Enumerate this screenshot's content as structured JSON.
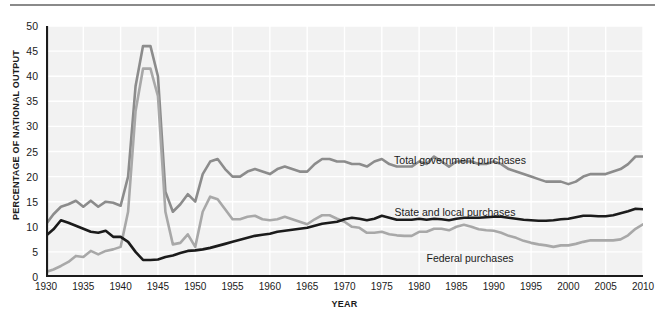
{
  "chart_data": {
    "type": "line",
    "title": "",
    "xlabel": "YEAR",
    "ylabel": "PERCENTAGE OF NATIONAL OUTPUT",
    "xlim": [
      1930,
      2010
    ],
    "ylim": [
      0,
      50
    ],
    "grid": true,
    "legend_position": "inline-annotations",
    "xticks": [
      "1930",
      "1935",
      "1940",
      "1945",
      "1950",
      "1955",
      "1960",
      "1965",
      "1970",
      "1975",
      "1980",
      "1985",
      "1990",
      "1995",
      "2000",
      "2005",
      "2010"
    ],
    "yticks": [
      "0",
      "5",
      "10",
      "15",
      "20",
      "25",
      "30",
      "35",
      "40",
      "45",
      "50"
    ],
    "x": [
      1930,
      1931,
      1932,
      1933,
      1934,
      1935,
      1936,
      1937,
      1938,
      1939,
      1940,
      1941,
      1942,
      1943,
      1944,
      1945,
      1946,
      1947,
      1948,
      1949,
      1950,
      1951,
      1952,
      1953,
      1954,
      1955,
      1956,
      1957,
      1958,
      1959,
      1960,
      1961,
      1962,
      1963,
      1964,
      1965,
      1966,
      1967,
      1968,
      1969,
      1970,
      1971,
      1972,
      1973,
      1974,
      1975,
      1976,
      1977,
      1978,
      1979,
      1980,
      1981,
      1982,
      1983,
      1984,
      1985,
      1986,
      1987,
      1988,
      1989,
      1990,
      1991,
      1992,
      1993,
      1994,
      1995,
      1996,
      1997,
      1998,
      1999,
      2000,
      2001,
      2002,
      2003,
      2004,
      2005,
      2006,
      2007,
      2008,
      2009,
      2010
    ],
    "series": [
      {
        "name": "Total government purchases",
        "color": "#8c8c8c",
        "values": [
          10.5,
          12.5,
          14.0,
          14.5,
          15.2,
          14.0,
          15.2,
          14.0,
          15.0,
          14.8,
          14.2,
          20.0,
          38.0,
          46.0,
          46.0,
          40.0,
          17.0,
          13.0,
          14.5,
          16.5,
          15.0,
          20.5,
          23.0,
          23.5,
          21.5,
          20.0,
          20.0,
          21.0,
          21.5,
          21.0,
          20.5,
          21.5,
          22.0,
          21.5,
          21.0,
          21.0,
          22.5,
          23.5,
          23.5,
          23.0,
          23.0,
          22.5,
          22.5,
          22.0,
          23.0,
          23.5,
          22.5,
          22.0,
          22.0,
          22.0,
          23.0,
          22.5,
          24.0,
          23.0,
          22.0,
          23.0,
          23.0,
          23.0,
          22.5,
          22.5,
          23.0,
          22.5,
          21.5,
          21.0,
          20.5,
          20.0,
          19.5,
          19.0,
          19.0,
          19.0,
          18.5,
          19.0,
          20.0,
          20.5,
          20.5,
          20.5,
          21.0,
          21.5,
          22.5,
          24.0,
          24.0
        ]
      },
      {
        "name": "State and local purchases",
        "color": "#1b1b1b",
        "values": [
          8.2,
          9.5,
          11.3,
          10.8,
          10.2,
          9.6,
          9.0,
          8.8,
          9.2,
          8.0,
          8.0,
          7.0,
          5.0,
          3.4,
          3.4,
          3.5,
          4.0,
          4.3,
          4.8,
          5.2,
          5.3,
          5.5,
          5.8,
          6.2,
          6.6,
          7.0,
          7.4,
          7.8,
          8.2,
          8.4,
          8.6,
          9.0,
          9.2,
          9.4,
          9.6,
          9.8,
          10.2,
          10.6,
          10.8,
          11.0,
          11.5,
          11.8,
          11.6,
          11.3,
          11.6,
          12.2,
          11.8,
          11.4,
          11.4,
          11.4,
          11.6,
          11.4,
          11.6,
          11.5,
          11.3,
          11.6,
          11.8,
          11.8,
          11.8,
          11.9,
          12.0,
          12.0,
          11.8,
          11.6,
          11.4,
          11.3,
          11.2,
          11.2,
          11.3,
          11.5,
          11.6,
          11.9,
          12.2,
          12.2,
          12.1,
          12.1,
          12.3,
          12.7,
          13.1,
          13.6,
          13.5
        ]
      },
      {
        "name": "Federal purchases",
        "color": "#a8a8a8",
        "values": [
          1.0,
          1.5,
          2.2,
          3.0,
          4.2,
          4.0,
          5.2,
          4.5,
          5.2,
          5.5,
          6.0,
          13.0,
          33.0,
          41.5,
          41.5,
          36.0,
          13.0,
          6.5,
          6.8,
          8.5,
          6.0,
          13.0,
          16.0,
          15.5,
          13.5,
          11.5,
          11.5,
          12.0,
          12.2,
          11.5,
          11.3,
          11.5,
          12.0,
          11.5,
          11.0,
          10.5,
          11.5,
          12.3,
          12.3,
          11.6,
          11.0,
          10.0,
          9.8,
          8.8,
          8.8,
          9.0,
          8.5,
          8.3,
          8.2,
          8.2,
          9.0,
          9.0,
          9.6,
          9.6,
          9.3,
          10.0,
          10.4,
          10.0,
          9.5,
          9.3,
          9.2,
          8.8,
          8.2,
          7.8,
          7.2,
          6.8,
          6.5,
          6.3,
          6.0,
          6.3,
          6.3,
          6.6,
          7.0,
          7.3,
          7.3,
          7.3,
          7.3,
          7.5,
          8.3,
          9.6,
          10.5
        ]
      }
    ],
    "annotations": [
      {
        "text": "Total government purchases",
        "x": 460,
        "y": 154
      },
      {
        "text": "State and local purchases",
        "x": 455,
        "y": 206
      },
      {
        "text": "Federal purchases",
        "x": 470,
        "y": 252
      }
    ]
  },
  "axes": {
    "ylabel": "PERCENTAGE OF NATIONAL OUTPUT",
    "xlabel": "YEAR"
  }
}
